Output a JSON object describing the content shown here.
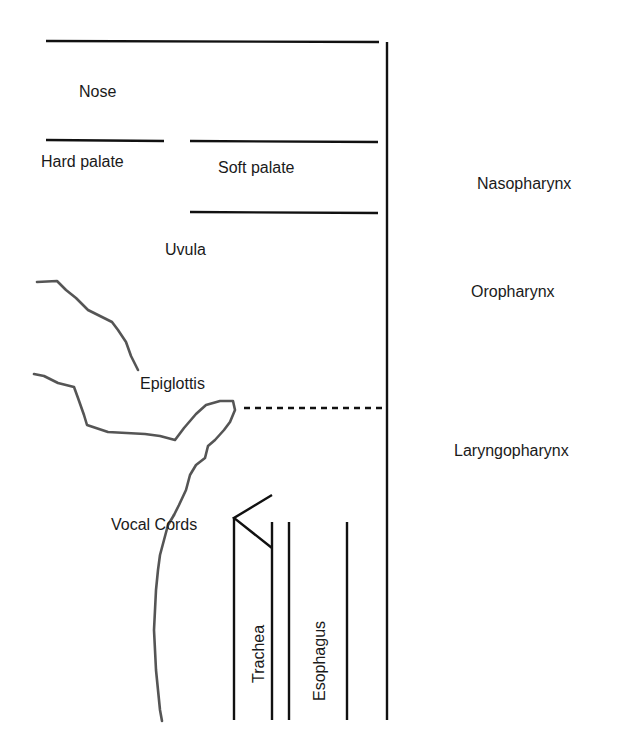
{
  "diagram": {
    "structures": {
      "nose": "Nose",
      "hard_palate": "Hard palate",
      "soft_palate": "Soft palate",
      "uvula": "Uvula",
      "epiglottis": "Epiglottis",
      "vocal_cords": "Vocal Cords",
      "trachea": "Trachea",
      "esophagus": "Esophagus"
    },
    "regions": {
      "nasopharynx": "Nasopharynx",
      "oropharynx": "Oropharynx",
      "laryngopharynx": "Laryngopharynx"
    },
    "colors": {
      "line": "#111111",
      "tissue_outline": "#555555",
      "text": "#1a1a1a",
      "background": "#ffffff"
    }
  }
}
